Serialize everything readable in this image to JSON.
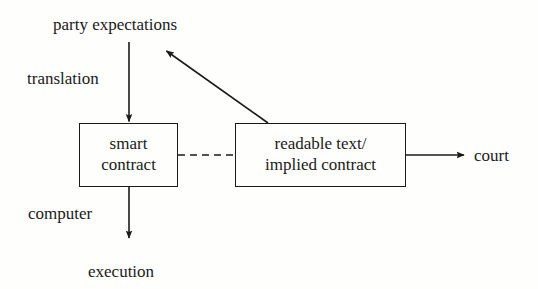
{
  "diagram": {
    "type": "flow-diagram",
    "background_color": "#fefefd",
    "stroke_color": "#1a1a1a",
    "nodes": [
      {
        "id": "smart-contract",
        "shape": "rectangle",
        "line1": "smart",
        "line2": "contract"
      },
      {
        "id": "readable-text",
        "shape": "rectangle",
        "line1": "readable text/",
        "line2": "implied contract"
      }
    ],
    "labels": {
      "party_expectations": "party expectations",
      "translation": "translation",
      "computer": "computer",
      "execution": "execution",
      "court": "court"
    },
    "edges": [
      {
        "id": "party-expectations-to-smart-contract",
        "from": "party expectations",
        "to": "smart contract",
        "label": "translation",
        "style": "solid",
        "arrow": "end"
      },
      {
        "id": "smart-contract-to-execution",
        "from": "smart contract",
        "to": "execution",
        "label": "computer",
        "style": "solid",
        "arrow": "end"
      },
      {
        "id": "smart-contract-to-readable-text",
        "from": "smart contract",
        "to": "readable text/implied contract",
        "label": "",
        "style": "dashed",
        "arrow": "none"
      },
      {
        "id": "readable-text-to-party-expectations",
        "from": "readable text/implied contract",
        "to": "party expectations",
        "label": "",
        "style": "solid",
        "arrow": "end"
      },
      {
        "id": "readable-text-to-court",
        "from": "readable text/implied contract",
        "to": "court",
        "label": "",
        "style": "solid",
        "arrow": "end"
      }
    ]
  }
}
